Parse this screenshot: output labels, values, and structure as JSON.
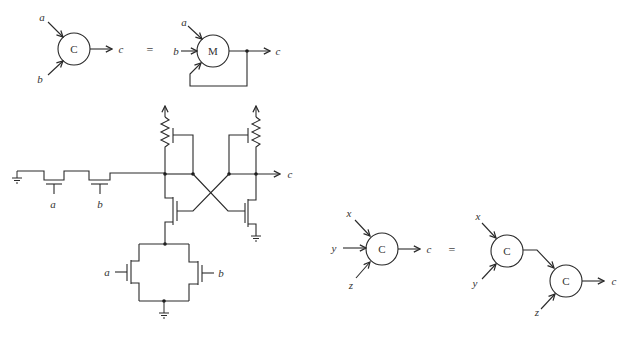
{
  "diagram": {
    "title": "",
    "top_equation": {
      "lhs": {
        "gate_label": "C",
        "inputs": [
          "a",
          "b"
        ],
        "output": "c"
      },
      "equals": "=",
      "rhs": {
        "gate_label": "M",
        "inputs": [
          "a",
          "b"
        ],
        "feedback_input": "c",
        "output": "c"
      }
    },
    "circuit": {
      "series_transistor_gates": [
        "a",
        "b"
      ],
      "parallel_transistor_gates": [
        "a",
        "b"
      ],
      "output": "c",
      "components": [
        "ground",
        "series-nmos-a",
        "series-nmos-b",
        "pullup-resistor-left",
        "pullup-resistor-right",
        "feedback-pmos-left",
        "feedback-pmos-right",
        "cross-coupled-nmos-left",
        "cross-coupled-nmos-right",
        "parallel-nmos-a",
        "parallel-nmos-b"
      ]
    },
    "bottom_equation": {
      "lhs": {
        "gate_label": "C",
        "inputs": [
          "x",
          "y",
          "z"
        ],
        "output": "c"
      },
      "equals": "=",
      "rhs": {
        "first_gate": {
          "gate_label": "C",
          "inputs": [
            "x",
            "y"
          ]
        },
        "second_gate": {
          "gate_label": "C",
          "inputs": [
            "z"
          ],
          "output": "c"
        }
      }
    }
  }
}
